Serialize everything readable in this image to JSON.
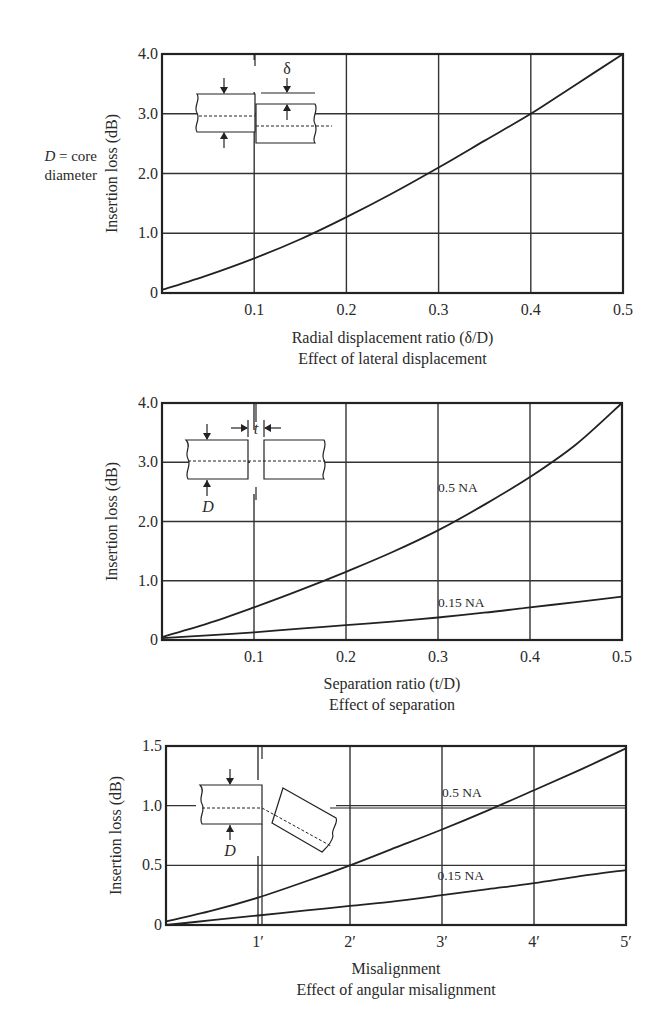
{
  "note": {
    "symbol": "D",
    "text": " = core",
    "text2": "diameter"
  },
  "chart_data": [
    {
      "type": "line",
      "title": "Effect of lateral displacement",
      "xlabel": "Radial displacement ratio (δ/D)",
      "ylabel": "Insertion loss (dB)",
      "xlim": [
        0,
        0.5
      ],
      "ylim": [
        0,
        4.0
      ],
      "xticks": [
        0.1,
        0.2,
        0.3,
        0.4,
        0.5
      ],
      "xtick_labels": [
        "0.1",
        "0.2",
        "0.3",
        "0.4",
        "0.5"
      ],
      "yticks": [
        0,
        1.0,
        2.0,
        3.0,
        4.0
      ],
      "ytick_labels": [
        "0",
        "1.0",
        "2.0",
        "3.0",
        "4.0"
      ],
      "grid": true,
      "inset": "lateral displacement diagram (δ)",
      "inset_label": "δ",
      "series": [
        {
          "name": "",
          "x": [
            0,
            0.05,
            0.1,
            0.15,
            0.2,
            0.25,
            0.3,
            0.35,
            0.4,
            0.45,
            0.5
          ],
          "values": [
            0.05,
            0.3,
            0.58,
            0.9,
            1.27,
            1.67,
            2.1,
            2.55,
            3.0,
            3.5,
            4.0
          ]
        }
      ]
    },
    {
      "type": "line",
      "title": "Effect of separation",
      "xlabel": "Separation ratio (t/D)",
      "ylabel": "Insertion loss (dB)",
      "xlim": [
        0,
        0.5
      ],
      "ylim": [
        0,
        4.0
      ],
      "xticks": [
        0.1,
        0.2,
        0.3,
        0.4,
        0.5
      ],
      "xtick_labels": [
        "0.1",
        "0.2",
        "0.3",
        "0.4",
        "0.5"
      ],
      "yticks": [
        0,
        1.0,
        2.0,
        3.0,
        4.0
      ],
      "ytick_labels": [
        "0",
        "1.0",
        "2.0",
        "3.0",
        "4.0"
      ],
      "grid": true,
      "inset": "fiber end separation diagram (t, D)",
      "inset_label_t": "t",
      "inset_label_d": "D",
      "series": [
        {
          "name": "0.5 NA",
          "label_pos": [
            0.3,
            2.5
          ],
          "x": [
            0,
            0.05,
            0.1,
            0.15,
            0.2,
            0.25,
            0.3,
            0.35,
            0.4,
            0.45,
            0.5
          ],
          "values": [
            0.05,
            0.28,
            0.55,
            0.84,
            1.15,
            1.48,
            1.85,
            2.28,
            2.75,
            3.3,
            4.0
          ]
        },
        {
          "name": "0.15 NA",
          "label_pos": [
            0.3,
            0.55
          ],
          "x": [
            0,
            0.05,
            0.1,
            0.15,
            0.2,
            0.25,
            0.3,
            0.35,
            0.4,
            0.45,
            0.5
          ],
          "values": [
            0.03,
            0.08,
            0.13,
            0.19,
            0.25,
            0.31,
            0.38,
            0.46,
            0.55,
            0.64,
            0.73
          ]
        }
      ]
    },
    {
      "type": "line",
      "title": "Effect of angular misalignment",
      "xlabel": "Misalignment",
      "ylabel": "Insertion loss (dB)",
      "xlim": [
        0,
        5
      ],
      "ylim": [
        0,
        1.5
      ],
      "xticks": [
        1,
        2,
        3,
        4,
        5
      ],
      "xtick_labels": [
        "1′",
        "2′",
        "3′",
        "4′",
        "5′"
      ],
      "yticks": [
        0,
        0.5,
        1.0,
        1.5
      ],
      "ytick_labels": [
        "0",
        "0.5",
        "1.0",
        "1.5"
      ],
      "grid": true,
      "inset": "angular misalignment diagram (D)",
      "inset_label_d": "D",
      "series": [
        {
          "name": "0.5 NA",
          "label_pos": [
            3.0,
            1.07
          ],
          "x": [
            0,
            0.5,
            1,
            1.5,
            2,
            2.5,
            3,
            3.5,
            4,
            4.5,
            5
          ],
          "values": [
            0.03,
            0.12,
            0.23,
            0.36,
            0.5,
            0.65,
            0.8,
            0.96,
            1.13,
            1.3,
            1.48
          ]
        },
        {
          "name": "0.15 NA",
          "label_pos": [
            2.95,
            0.38
          ],
          "x": [
            0,
            0.5,
            1,
            1.5,
            2,
            2.5,
            3,
            3.5,
            4,
            4.5,
            5
          ],
          "values": [
            0.0,
            0.04,
            0.08,
            0.12,
            0.16,
            0.2,
            0.25,
            0.3,
            0.35,
            0.41,
            0.46
          ]
        }
      ]
    }
  ]
}
